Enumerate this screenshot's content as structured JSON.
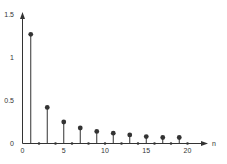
{
  "chart_data": {
    "type": "stem",
    "title": "",
    "xlabel": "n",
    "ylabel": "",
    "x": [
      0,
      1,
      2,
      3,
      4,
      5,
      6,
      7,
      8,
      9,
      10,
      11,
      12,
      13,
      14,
      15,
      16,
      17,
      18,
      19,
      20
    ],
    "values": [
      0,
      1.27,
      0,
      0.42,
      0,
      0.25,
      0,
      0.18,
      0,
      0.14,
      0,
      0.12,
      0,
      0.1,
      0,
      0.08,
      0,
      0.07,
      0,
      0.07,
      0
    ],
    "xticks": [
      "0",
      "5",
      "10",
      "15",
      "20"
    ],
    "yticks": [
      "0",
      "0.5",
      "1",
      "1.5"
    ],
    "xlim": [
      0,
      22
    ],
    "ylim": [
      0,
      1.5
    ],
    "grid": false,
    "legend": null
  },
  "colors": {
    "stem": "#333333",
    "axis": "#333333"
  }
}
